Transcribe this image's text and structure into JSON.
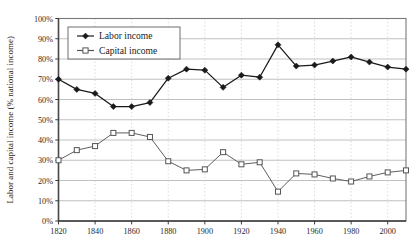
{
  "chart_data": {
    "type": "line",
    "title": "",
    "subtitle": "",
    "xlabel": "",
    "ylabel": "Labor and capital income (% national income)",
    "xlim": [
      1820,
      2010
    ],
    "ylim": [
      0,
      100
    ],
    "grid": true,
    "legend_position": "top-left",
    "x": [
      1820,
      1830,
      1840,
      1850,
      1860,
      1870,
      1880,
      1890,
      1900,
      1910,
      1920,
      1930,
      1940,
      1950,
      1960,
      1970,
      1980,
      1990,
      2000,
      2010
    ],
    "x_ticks": [
      "1820",
      "1840",
      "1860",
      "1880",
      "1900",
      "1920",
      "1940",
      "1960",
      "1980",
      "2000"
    ],
    "x_tick_values": [
      1820,
      1840,
      1860,
      1880,
      1900,
      1920,
      1940,
      1960,
      1980,
      2000
    ],
    "y_ticks": [
      "0%",
      "10%",
      "20%",
      "30%",
      "40%",
      "50%",
      "60%",
      "70%",
      "80%",
      "90%",
      "100%"
    ],
    "y_tick_values": [
      0,
      10,
      20,
      30,
      40,
      50,
      60,
      70,
      80,
      90,
      100
    ],
    "series": [
      {
        "name": "Labor income",
        "marker": "filled-diamond",
        "color": "#1a1a1a",
        "values": [
          70,
          65,
          63,
          56.5,
          56.5,
          58.5,
          70.5,
          75,
          74.5,
          66,
          72,
          71,
          87,
          76.5,
          77,
          79,
          81,
          78.5,
          76,
          75
        ]
      },
      {
        "name": "Capital income",
        "marker": "open-square",
        "color": "#555555",
        "values": [
          30,
          35,
          37,
          43.5,
          43.5,
          41.5,
          29.5,
          25,
          25.5,
          34,
          28,
          29,
          14.5,
          23.5,
          23,
          21,
          19.5,
          22,
          24,
          25
        ]
      }
    ]
  },
  "legend": {
    "items": [
      {
        "label": "Labor income"
      },
      {
        "label": "Capital income"
      }
    ]
  },
  "axes": {
    "y_axis_title": "Labor and capital income (% national income)"
  }
}
